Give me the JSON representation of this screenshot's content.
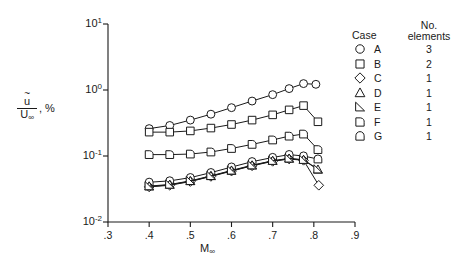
{
  "axes": {
    "x": {
      "label": "M",
      "label_sub": "∞",
      "ticks": [
        ".3",
        ".4",
        ".5",
        ".6",
        ".7",
        ".8",
        ".9"
      ],
      "tick_values": [
        0.3,
        0.4,
        0.5,
        0.6,
        0.7,
        0.8,
        0.9
      ],
      "min": 0.3,
      "max": 0.9
    },
    "y": {
      "label_num": "u",
      "label_den": "U",
      "label_den_sub": "∞",
      "label_suffix": ", %",
      "ticks": [
        "10",
        "10",
        "10",
        "10"
      ],
      "tick_exponents": [
        "1",
        "0",
        "-1",
        "-2"
      ],
      "tick_values": [
        10,
        1,
        0.1,
        0.01
      ],
      "min": 0.01,
      "max": 10
    }
  },
  "legend": {
    "header_case": "Case",
    "header_elements_line1": "No.",
    "header_elements_line2": "elements",
    "rows": [
      {
        "symbol": "circle",
        "case": "A",
        "elements": "3"
      },
      {
        "symbol": "square",
        "case": "B",
        "elements": "2"
      },
      {
        "symbol": "diamond",
        "case": "C",
        "elements": "1"
      },
      {
        "symbol": "triangle",
        "case": "D",
        "elements": "1"
      },
      {
        "symbol": "flag-e",
        "case": "E",
        "elements": "1"
      },
      {
        "symbol": "flag-f",
        "case": "F",
        "elements": "1"
      },
      {
        "symbol": "flag-g",
        "case": "G",
        "elements": "1"
      }
    ]
  },
  "chart_data": {
    "type": "line",
    "title": "",
    "xlabel": "M∞",
    "ylabel": "ū/U∞, %",
    "xlim": [
      0.3,
      0.9
    ],
    "ylim": [
      0.01,
      10
    ],
    "yscale": "log",
    "grid": false,
    "legend_position": "right",
    "series": [
      {
        "name": "A",
        "elements": 3,
        "marker": "circle",
        "x": [
          0.4,
          0.45,
          0.5,
          0.55,
          0.6,
          0.65,
          0.7,
          0.74,
          0.775,
          0.805
        ],
        "y": [
          0.26,
          0.29,
          0.35,
          0.43,
          0.54,
          0.68,
          0.85,
          1.05,
          1.25,
          1.22
        ]
      },
      {
        "name": "B",
        "elements": 2,
        "marker": "square",
        "x": [
          0.4,
          0.45,
          0.5,
          0.55,
          0.6,
          0.65,
          0.7,
          0.74,
          0.775,
          0.81
        ],
        "y": [
          0.23,
          0.23,
          0.24,
          0.265,
          0.3,
          0.35,
          0.42,
          0.5,
          0.58,
          0.33
        ]
      },
      {
        "name": "F",
        "elements": 1,
        "marker": "flag-f",
        "x": [
          0.4,
          0.45,
          0.5,
          0.55,
          0.6,
          0.65,
          0.7,
          0.74,
          0.775,
          0.81
        ],
        "y": [
          0.105,
          0.105,
          0.107,
          0.115,
          0.13,
          0.15,
          0.175,
          0.2,
          0.215,
          0.125
        ]
      },
      {
        "name": "G",
        "elements": 1,
        "marker": "flag-g",
        "x": [
          0.4,
          0.45,
          0.5,
          0.55,
          0.6,
          0.65,
          0.7,
          0.74,
          0.775,
          0.81
        ],
        "y": [
          0.04,
          0.042,
          0.047,
          0.056,
          0.068,
          0.082,
          0.095,
          0.105,
          0.1,
          0.09
        ]
      },
      {
        "name": "C",
        "elements": 1,
        "marker": "diamond",
        "x": [
          0.4,
          0.45,
          0.5,
          0.55,
          0.6,
          0.65,
          0.7,
          0.74,
          0.775,
          0.812
        ],
        "y": [
          0.034,
          0.036,
          0.041,
          0.049,
          0.059,
          0.071,
          0.083,
          0.09,
          0.086,
          0.036
        ]
      },
      {
        "name": "D",
        "elements": 1,
        "marker": "triangle",
        "x": [
          0.4,
          0.45,
          0.5,
          0.55,
          0.6,
          0.65,
          0.7,
          0.74,
          0.775,
          0.81
        ],
        "y": [
          0.0345,
          0.0365,
          0.0415,
          0.0495,
          0.0597,
          0.0718,
          0.084,
          0.091,
          0.087,
          0.062
        ]
      },
      {
        "name": "E",
        "elements": 1,
        "marker": "flag-e",
        "x": [
          0.4,
          0.45,
          0.5,
          0.55,
          0.6,
          0.65,
          0.7,
          0.74,
          0.775,
          0.81
        ],
        "y": [
          0.035,
          0.037,
          0.042,
          0.05,
          0.0604,
          0.0725,
          0.0848,
          0.092,
          0.0878,
          0.063
        ]
      }
    ]
  },
  "style": {
    "line_color": "#1a1a1a",
    "marker_fill": "#ffffff",
    "axis_color": "#1a1a1a"
  }
}
